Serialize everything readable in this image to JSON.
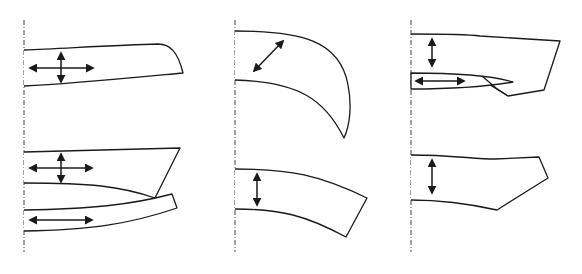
{
  "figure": {
    "type": "pattern-piece-diagram",
    "stroke_color": "#1a1a1a",
    "background": "#ffffff",
    "columns": [
      {
        "id": "left",
        "fold_line_x": 24,
        "pieces": [
          {
            "id": "piece-1",
            "arrows": [
              "horizontal",
              "vertical"
            ]
          },
          {
            "id": "piece-2",
            "arrows": [
              "horizontal",
              "vertical"
            ]
          },
          {
            "id": "piece-3",
            "arrows": [
              "horizontal"
            ]
          }
        ]
      },
      {
        "id": "middle",
        "fold_line_x": 235,
        "pieces": [
          {
            "id": "piece-4",
            "arrows": [
              "diagonal"
            ]
          },
          {
            "id": "piece-5",
            "arrows": [
              "vertical"
            ]
          }
        ]
      },
      {
        "id": "right",
        "fold_line_x": 411,
        "pieces": [
          {
            "id": "piece-6",
            "arrows": [
              "vertical",
              "horizontal"
            ]
          },
          {
            "id": "piece-7",
            "arrows": [
              "vertical"
            ]
          }
        ]
      }
    ],
    "caption": ""
  }
}
